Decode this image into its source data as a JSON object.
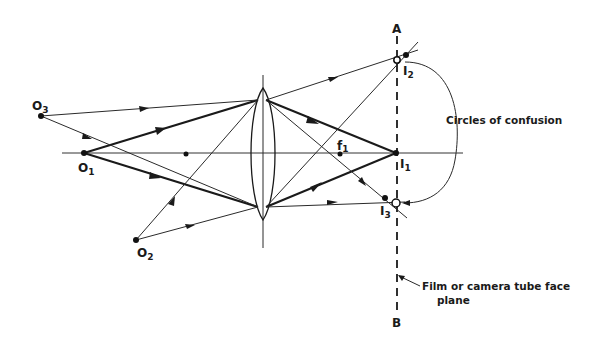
{
  "diagram": {
    "labels": {
      "plane_top": "A",
      "plane_bottom": "B",
      "circles_of_confusion": "Circles of confusion",
      "film_plane_line1": "Film or camera tube face",
      "film_plane_line2": "plane"
    },
    "objects": [
      {
        "id": "O1",
        "letter": "O",
        "sub": "1"
      },
      {
        "id": "O2",
        "letter": "O",
        "sub": "2"
      },
      {
        "id": "O3",
        "letter": "O",
        "sub": "3"
      }
    ],
    "images": [
      {
        "id": "I1",
        "letter": "I",
        "sub": "1"
      },
      {
        "id": "I2",
        "letter": "I",
        "sub": "2"
      },
      {
        "id": "I3",
        "letter": "I",
        "sub": "3"
      }
    ],
    "focal_point": {
      "letter": "f",
      "sub": "1"
    },
    "colors": {
      "ink": "#1a1a1a",
      "background": "#ffffff"
    }
  }
}
